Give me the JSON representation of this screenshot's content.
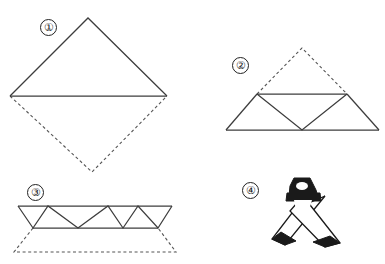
{
  "figure": {
    "canvas": {
      "width": 385,
      "height": 264,
      "background": "#ffffff"
    },
    "line_color": "#3d3d3d",
    "fill_color": "#1a1a1a",
    "solid_line_style": "solid",
    "dashed_line_style": "dashed"
  },
  "steps": [
    {
      "id": "step-1",
      "label": "①",
      "number": 1,
      "name": "fold-square-to-triangle",
      "label_position": {
        "x": 40,
        "y": 19
      },
      "solid_shape": "triangle",
      "solid_points": "88,18 167,96 10,96",
      "dashed_points": "10,96 92,172 167,96",
      "crease_line": "10,96 167,96"
    },
    {
      "id": "step-2",
      "label": "②",
      "number": 2,
      "name": "fold-apex-down",
      "label_position": {
        "x": 232,
        "y": 57
      },
      "solid_outline": "257,94 302,48 347,94 379,130 226,130",
      "dashed_points": "257,94 302,48 347,94",
      "mid_line": "257,94 347,94",
      "inner_v": "257,94 302,130 347,94",
      "base_line": "226,130 379,130",
      "left_edge": "257,94 226,130",
      "right_edge": "347,94 379,130"
    },
    {
      "id": "step-3",
      "label": "③",
      "number": 3,
      "name": "pleat-flatten",
      "label_position": {
        "x": 27,
        "y": 184
      },
      "top_line": "18,206 172,206",
      "bottom_line": "33,228 158,228",
      "zigzag_top": "18,206 48,206 78,206 108,206 138,206 172,206",
      "zigzag_bottom": "33,228 63,228 93,228 123,228 158,228",
      "dashed_outline": "33,228 14,252 176,252 158,228"
    },
    {
      "id": "step-4",
      "label": "④",
      "number": 4,
      "name": "finished-form",
      "label_position": {
        "x": 242,
        "y": 182
      },
      "description": "dark knot at top with two crossing legs ending in solid dark tips"
    }
  ]
}
